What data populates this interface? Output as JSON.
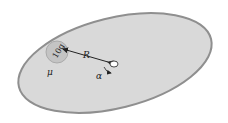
{
  "diagram": {
    "colors": {
      "disk_fill": "#d9d9d9",
      "disk_stroke": "#8f8f8f",
      "coin_fill": "#c4c4c4",
      "ink": "#222222"
    },
    "coin": {
      "label": "10g"
    },
    "labels": {
      "radius": "R",
      "friction": "μ",
      "angular_accel": "α"
    }
  }
}
